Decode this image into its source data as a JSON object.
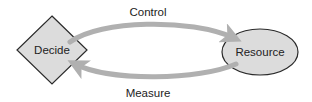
{
  "diagram": {
    "nodes": {
      "decide": {
        "label": "Decide",
        "shape": "diamond"
      },
      "resource": {
        "label": "Resource",
        "shape": "ellipse"
      }
    },
    "edges": {
      "control": {
        "label": "Control",
        "from": "Decide",
        "to": "Resource"
      },
      "measure": {
        "label": "Measure",
        "from": "Resource",
        "to": "Decide"
      }
    },
    "colors": {
      "node_fill": "#dcdcdc",
      "node_stroke": "#2a2a2a",
      "arrow": "#b0b0b0",
      "text": "#222222"
    }
  }
}
